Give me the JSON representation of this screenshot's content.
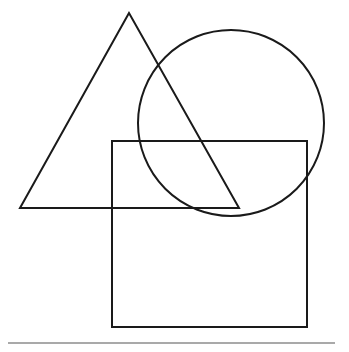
{
  "diagram": {
    "title": "",
    "stroke_color": "#1a1a1a",
    "line_color": "#555555",
    "background": "#ffffff",
    "shapes": [
      {
        "type": "triangle",
        "points": [
          [
            129,
            13
          ],
          [
            20,
            208
          ],
          [
            239,
            208
          ]
        ]
      },
      {
        "type": "circle",
        "cx": 231,
        "cy": 123,
        "r": 93
      },
      {
        "type": "rectangle",
        "x": 112,
        "y": 141,
        "width": 195,
        "height": 186
      },
      {
        "type": "line",
        "x1": 8,
        "y1": 343,
        "x2": 335,
        "y2": 343
      }
    ]
  }
}
